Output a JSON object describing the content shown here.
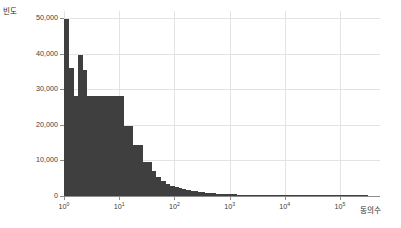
{
  "chart_data": {
    "type": "bar",
    "title": "",
    "subtitle": "",
    "xlabel": "동의수",
    "ylabel": "빈도",
    "xscale": "log",
    "yscale": "linear",
    "ylim": [
      0,
      52000
    ],
    "xlim": [
      1,
      380000
    ],
    "grid": true,
    "legend": null,
    "ytick_labels": [
      "0",
      "10,000",
      "20,000",
      "30,000",
      "40,000",
      "50,000"
    ],
    "ytick_values": [
      0,
      10000,
      20000,
      30000,
      40000,
      50000
    ],
    "xtick_labels": [
      "10⁰",
      "10¹",
      "10²",
      "10³",
      "10⁴",
      "10⁵"
    ],
    "xtick_bases": [
      "10",
      "10",
      "10",
      "10",
      "10",
      "10"
    ],
    "xtick_exponents": [
      "0",
      "1",
      "2",
      "3",
      "4",
      "5"
    ],
    "xtick_values": [
      1,
      10,
      100,
      1000,
      10000,
      100000
    ],
    "bar_color": "#3f3f3f",
    "grid_color": "#e3e3e3",
    "axis_color": "#8c8c8c",
    "x_log": [
      0.0,
      0.0417,
      0.0833,
      0.125,
      0.1667,
      0.2083,
      0.25,
      0.2917,
      0.3333,
      0.375,
      0.4167,
      0.4583,
      0.5,
      0.5417,
      0.5833,
      0.625,
      0.6667,
      0.7083,
      0.75,
      0.7917,
      0.8333,
      0.875,
      0.9167,
      0.9583,
      1.0,
      1.0417,
      1.0833,
      1.125,
      1.1667,
      1.2083,
      1.25,
      1.2917,
      1.3333,
      1.375,
      1.4167,
      1.4583,
      1.5,
      1.5417,
      1.5833,
      1.625,
      1.6667,
      1.7083,
      1.75,
      1.7917,
      1.8333,
      1.875,
      1.9167,
      1.9583,
      2.0,
      2.0417,
      2.0833,
      2.125,
      2.1667,
      2.2083,
      2.25,
      2.2917,
      2.3333,
      2.375,
      2.4167,
      2.4583,
      2.5,
      2.5417,
      2.5833,
      2.625,
      2.6667,
      2.7083,
      2.75,
      2.7917,
      2.8333,
      2.875,
      2.9167,
      2.9583,
      3.0,
      3.0417,
      3.0833,
      3.125,
      3.1667,
      3.2083,
      3.25,
      3.2917,
      3.3333,
      3.375,
      3.4167,
      3.4583,
      3.5,
      3.5417,
      3.5833,
      3.625,
      3.6667,
      3.7083,
      3.75,
      3.7917,
      3.8333,
      3.875,
      3.9167,
      3.9583,
      4.0,
      4.0417,
      4.0833,
      4.125,
      4.1667,
      4.2083,
      4.25,
      4.2917,
      4.3333,
      4.375,
      4.4167,
      4.4583,
      4.5,
      4.5417,
      4.5833,
      4.625,
      4.6667,
      4.7083,
      4.75,
      4.7917,
      4.8333,
      4.875,
      4.9167,
      4.9583,
      5.0,
      5.0417,
      5.0833,
      5.125,
      5.1667,
      5.2083,
      5.25,
      5.2917,
      5.3333,
      5.375,
      5.4167,
      5.4583
    ],
    "values": [
      49800,
      49800,
      36000,
      36000,
      28000,
      28000,
      39500,
      39500,
      35500,
      35500,
      28000,
      28000,
      28000,
      28000,
      28000,
      28000,
      28000,
      28000,
      28000,
      28000,
      28000,
      28000,
      28000,
      28000,
      28000,
      28000,
      19800,
      19800,
      19800,
      19800,
      14400,
      14400,
      14400,
      14400,
      9600,
      9600,
      9600,
      9600,
      7000,
      7000,
      5400,
      5400,
      4200,
      4200,
      3400,
      3400,
      2900,
      2900,
      2500,
      2400,
      2200,
      2000,
      1850,
      1700,
      1600,
      1480,
      1380,
      1280,
      1180,
      1100,
      1020,
      950,
      890,
      830,
      780,
      730,
      690,
      650,
      610,
      575,
      545,
      515,
      490,
      465,
      440,
      420,
      400,
      380,
      360,
      345,
      330,
      315,
      300,
      290,
      275,
      265,
      255,
      245,
      235,
      225,
      215,
      210,
      200,
      192,
      185,
      178,
      170,
      165,
      158,
      152,
      147,
      142,
      137,
      132,
      128,
      124,
      120,
      116,
      112,
      108,
      105,
      101,
      98,
      95,
      92,
      89,
      86,
      84,
      81,
      79,
      76,
      74,
      72,
      70,
      68,
      66,
      64,
      62,
      60,
      58,
      57,
      55
    ]
  },
  "axes": {
    "ylabel_text": "빈도",
    "xlabel_text": "동의수"
  }
}
